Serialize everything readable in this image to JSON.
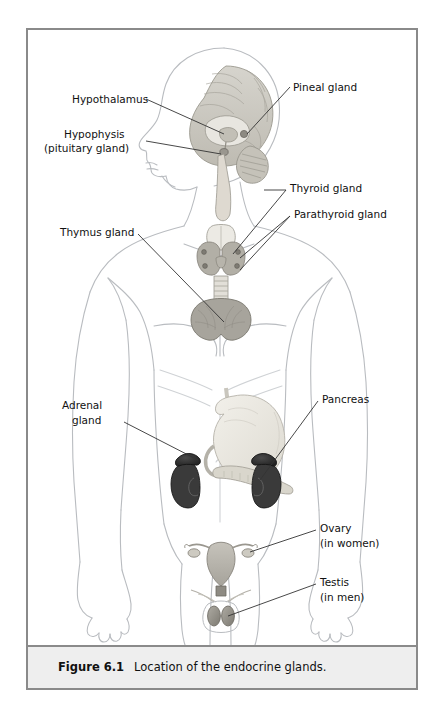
{
  "figure": {
    "caption_label": "Figure 6.1",
    "caption_body": "Location of the endocrine glands.",
    "frame_border_color": "#8a8a8a",
    "caption_band_color": "#eeeeee",
    "background_color": "#ffffff"
  },
  "labels": {
    "hypothalamus": "Hypothalamus",
    "hypophysis_line1": "Hypophysis",
    "hypophysis_line2": "(pituitary gland)",
    "pineal": "Pineal gland",
    "thyroid": "Thyroid gland",
    "parathyroid": "Parathyroid gland",
    "thymus": "Thymus gland",
    "adrenal_line1": "Adrenal",
    "adrenal_line2": "gland",
    "pancreas": "Pancreas",
    "ovary_line1": "Ovary",
    "ovary_line2": "(in women)",
    "testis_line1": "Testis",
    "testis_line2": "(in men)"
  },
  "anatomy": {
    "body_outline_color": "#b9bcc0",
    "brain_fill": "#cfcdc6",
    "brain_detail": "#a9a79f",
    "thyroid_fill": "#e4e2dc",
    "parathyroid_fill": "#9d9a92",
    "thymus_fill": "#a7a49c",
    "stomach_fill": "#e9e7df",
    "pancreas_fill": "#dedbd1",
    "adrenal_fill": "#2e2e2e",
    "kidney_fill": "#3a3a3a",
    "uterus_fill": "#b6b3ab",
    "ovary_fill": "#d6d3cb",
    "testis_fill": "#8e8b83",
    "leader_line_color": "#333333"
  }
}
